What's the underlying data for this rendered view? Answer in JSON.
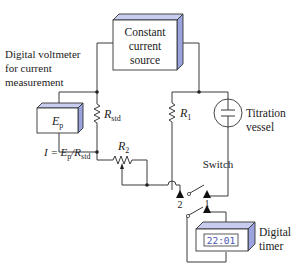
{
  "figure": {
    "components": {
      "current_source": {
        "line1": "Constant",
        "line2": "current",
        "line3": "source"
      },
      "voltmeter": {
        "caption_line1": "Digital voltmeter",
        "caption_line2": "for current",
        "caption_line3": "measurement",
        "symbol": "E",
        "symbol_sub": "p"
      },
      "r_std": {
        "symbol": "R",
        "sub": "std"
      },
      "r1": {
        "symbol": "R",
        "sub": "1"
      },
      "r2": {
        "symbol": "R",
        "sub": "2"
      },
      "equation": {
        "lhs": "I = E",
        "sub1": "p",
        "mid": "/R",
        "sub2": "std"
      },
      "titration_vessel": {
        "line1": "Titration",
        "line2": "vessel"
      },
      "switch": {
        "label": "Switch",
        "contact_2": "2",
        "contact_1": "1"
      },
      "timer": {
        "line1": "Digital",
        "line2": "timer",
        "display": "22:01"
      }
    },
    "colors": {
      "box_side": "#9aa3dd",
      "box_top": "#c8ccee",
      "display_text": "#4a55b0",
      "wire": "#3a3a3a"
    }
  }
}
